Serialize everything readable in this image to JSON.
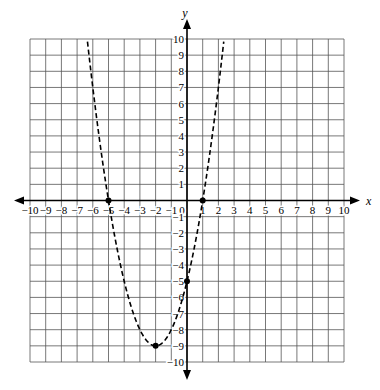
{
  "chart_data": {
    "type": "line",
    "title": "",
    "xlabel": "x",
    "ylabel": "y",
    "xlim": [
      -10,
      10
    ],
    "ylim": [
      -10,
      10
    ],
    "grid": true,
    "x_ticks": [
      -10,
      -9,
      -8,
      -7,
      -6,
      -5,
      -4,
      -3,
      -2,
      -1,
      0,
      1,
      2,
      3,
      4,
      5,
      6,
      7,
      8,
      9,
      10
    ],
    "y_ticks": [
      -10,
      -9,
      -8,
      -7,
      -6,
      -5,
      -4,
      -3,
      -2,
      -1,
      1,
      2,
      3,
      4,
      5,
      6,
      7,
      8,
      9,
      10
    ],
    "series": [
      {
        "name": "y = x^2 + 4x - 5",
        "style": "dashed",
        "equation": {
          "a": 1,
          "b": 4,
          "c": -5
        }
      }
    ],
    "points": [
      {
        "x": -5,
        "y": 0,
        "label": "x-intercept"
      },
      {
        "x": 1,
        "y": 0,
        "label": "x-intercept"
      },
      {
        "x": 0,
        "y": -5,
        "label": "y-intercept"
      },
      {
        "x": -2,
        "y": -9,
        "label": "vertex"
      }
    ]
  }
}
